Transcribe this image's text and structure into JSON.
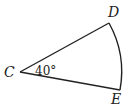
{
  "figure": {
    "type": "circular-sector",
    "vertices": {
      "center": "C",
      "end1": "D",
      "end2": "E"
    },
    "labels": {
      "C": "C",
      "D": "D",
      "E": "E"
    },
    "angle_label": "40°",
    "stroke_color": "#222222",
    "background": "#ffffff"
  }
}
